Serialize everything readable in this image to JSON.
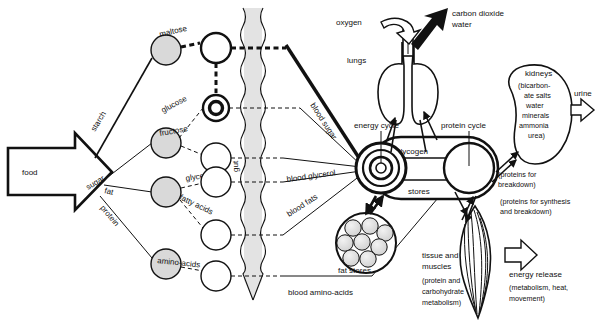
{
  "figure": {
    "background": "#ffffff",
    "ink": "#111111",
    "fill_gray": "#d9d9d9"
  },
  "input": {
    "food_label": "food"
  },
  "food_classes": [
    {
      "id": "starch",
      "label": "starch"
    },
    {
      "id": "sugar",
      "label": "sugar"
    },
    {
      "id": "fat",
      "label": "fat"
    },
    {
      "id": "protein",
      "label": "protein"
    }
  ],
  "digestion_products": [
    {
      "id": "maltose",
      "label": "maltose"
    },
    {
      "id": "glucose",
      "label": "glucose"
    },
    {
      "id": "fructose",
      "label": "fructose"
    },
    {
      "id": "glycerol",
      "label": "glycerol"
    },
    {
      "id": "fatty-acids",
      "label": "fatty acids"
    },
    {
      "id": "amino-acids",
      "label": "amino-acids"
    }
  ],
  "gut": {
    "label": "gut"
  },
  "blood_transport": [
    {
      "id": "blood-sugar",
      "label": "blood sugar"
    },
    {
      "id": "blood-glycerol",
      "label": "blood glycerol"
    },
    {
      "id": "blood-fats",
      "label": "blood fats"
    },
    {
      "id": "blood-amino-acids",
      "label": "blood amino-acids"
    }
  ],
  "cycles": {
    "energy": "energy cycle",
    "protein": "protein cycle",
    "glycogen": "glycogen",
    "stores": "stores"
  },
  "respiration": {
    "organ_label": "lungs",
    "input_label": "oxygen",
    "output_label_line1": "carbon dioxide",
    "output_label_line2": "water"
  },
  "kidneys": {
    "title": "kidneys",
    "contents": [
      "(bicarbon-",
      "ate salts",
      "water",
      "minerals",
      "ammonia",
      "urea)"
    ],
    "output_label": "urine"
  },
  "protein_notes": {
    "breakdown": [
      "(proteins for",
      "breakdown)"
    ],
    "synthesis": [
      "(proteins for synthesis",
      "and breakdown)"
    ]
  },
  "fat_stores": {
    "label": "fat stores"
  },
  "tissue": {
    "lines": [
      "tissue and",
      "muscles"
    ],
    "notes": [
      "(protein and",
      "carbohydrate",
      "metabolism)"
    ]
  },
  "energy_release": {
    "title": "energy release",
    "notes": [
      "(metabolism, heat,",
      "movement)"
    ]
  }
}
